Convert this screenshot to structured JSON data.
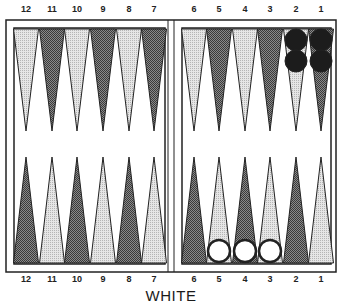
{
  "board": {
    "side_label": "WHITE",
    "colors": {
      "light_point": "#d9d9d9",
      "dark_point": "#6b6b6b",
      "outline": "#222222",
      "black_checker": "#1c1c1c",
      "white_checker": "#ffffff"
    },
    "top_numbers": [
      "12",
      "11",
      "10",
      "9",
      "8",
      "7",
      "6",
      "5",
      "4",
      "3",
      "2",
      "1"
    ],
    "bottom_numbers": [
      "12",
      "11",
      "10",
      "9",
      "8",
      "7",
      "6",
      "5",
      "4",
      "3",
      "2",
      "1"
    ],
    "top_points": [
      {
        "number": "12",
        "shade": "light",
        "checkers": 0,
        "checker_color": ""
      },
      {
        "number": "11",
        "shade": "dark",
        "checkers": 0,
        "checker_color": ""
      },
      {
        "number": "10",
        "shade": "light",
        "checkers": 0,
        "checker_color": ""
      },
      {
        "number": "9",
        "shade": "dark",
        "checkers": 0,
        "checker_color": ""
      },
      {
        "number": "8",
        "shade": "light",
        "checkers": 0,
        "checker_color": ""
      },
      {
        "number": "7",
        "shade": "dark",
        "checkers": 0,
        "checker_color": ""
      },
      {
        "number": "6",
        "shade": "light",
        "checkers": 0,
        "checker_color": ""
      },
      {
        "number": "5",
        "shade": "dark",
        "checkers": 0,
        "checker_color": ""
      },
      {
        "number": "4",
        "shade": "light",
        "checkers": 0,
        "checker_color": ""
      },
      {
        "number": "3",
        "shade": "dark",
        "checkers": 0,
        "checker_color": ""
      },
      {
        "number": "2",
        "shade": "light",
        "checkers": 2,
        "checker_color": "black"
      },
      {
        "number": "1",
        "shade": "dark",
        "checkers": 2,
        "checker_color": "black"
      }
    ],
    "bottom_points": [
      {
        "number": "12",
        "shade": "dark",
        "checkers": 0,
        "checker_color": ""
      },
      {
        "number": "11",
        "shade": "light",
        "checkers": 0,
        "checker_color": ""
      },
      {
        "number": "10",
        "shade": "dark",
        "checkers": 0,
        "checker_color": ""
      },
      {
        "number": "9",
        "shade": "light",
        "checkers": 0,
        "checker_color": ""
      },
      {
        "number": "8",
        "shade": "dark",
        "checkers": 0,
        "checker_color": ""
      },
      {
        "number": "7",
        "shade": "light",
        "checkers": 0,
        "checker_color": ""
      },
      {
        "number": "6",
        "shade": "dark",
        "checkers": 0,
        "checker_color": ""
      },
      {
        "number": "5",
        "shade": "light",
        "checkers": 1,
        "checker_color": "white"
      },
      {
        "number": "4",
        "shade": "dark",
        "checkers": 1,
        "checker_color": "white"
      },
      {
        "number": "3",
        "shade": "light",
        "checkers": 1,
        "checker_color": "white"
      },
      {
        "number": "2",
        "shade": "dark",
        "checkers": 0,
        "checker_color": ""
      },
      {
        "number": "1",
        "shade": "light",
        "checkers": 0,
        "checker_color": ""
      }
    ]
  }
}
